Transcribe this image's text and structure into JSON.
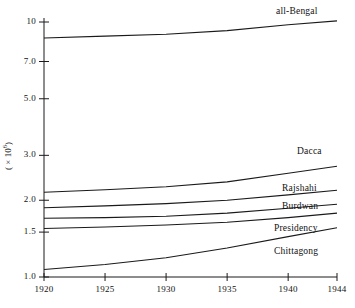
{
  "chart_data": {
    "type": "line",
    "title": "",
    "xlabel": "",
    "ylabel": "( × 10⁶ )",
    "ylabel_base": "( × 10",
    "ylabel_exp": "6",
    "xlim": [
      1920,
      1944
    ],
    "ylim": [
      1.0,
      10.5
    ],
    "yscale": "log",
    "grid": false,
    "legend_position": "right-inline",
    "xticks": [
      1920,
      1925,
      1930,
      1935,
      1940,
      1944
    ],
    "xtick_labels": [
      "1920",
      "1925",
      "1930",
      "1935",
      "1940",
      "1944"
    ],
    "yticks": [
      1.0,
      1.5,
      2.0,
      3.0,
      5.0,
      7.0,
      10
    ],
    "ytick_labels": [
      "1.0",
      "1.5",
      "2.0",
      "3.0",
      "5.0",
      "7.0",
      "10"
    ],
    "x": [
      1920,
      1925,
      1930,
      1935,
      1940,
      1944
    ],
    "series": [
      {
        "name": "all-Bengal",
        "label": "all-Bengal",
        "values": [
          8.65,
          8.8,
          8.95,
          9.25,
          9.75,
          10.1
        ]
      },
      {
        "name": "Dacca",
        "label": "Dacca",
        "values": [
          2.15,
          2.2,
          2.26,
          2.36,
          2.55,
          2.72
        ]
      },
      {
        "name": "Rajshahi",
        "label": "Rajshahi",
        "values": [
          1.87,
          1.9,
          1.94,
          2.0,
          2.1,
          2.19
        ]
      },
      {
        "name": "Burdwan",
        "label": "Burdwan",
        "values": [
          1.7,
          1.71,
          1.73,
          1.78,
          1.86,
          1.93
        ]
      },
      {
        "name": "Presidency",
        "label": "Presidency",
        "values": [
          1.55,
          1.57,
          1.6,
          1.64,
          1.71,
          1.78
        ]
      },
      {
        "name": "Chittagong",
        "label": "Chittagong",
        "values": [
          1.07,
          1.12,
          1.19,
          1.3,
          1.44,
          1.56
        ]
      }
    ]
  }
}
